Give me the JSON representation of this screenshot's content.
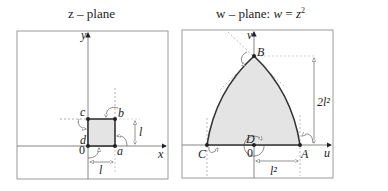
{
  "figure": {
    "left_panel": {
      "title": "z – plane",
      "axis_x_label": "x",
      "axis_y_label": "y",
      "origin_label": "0",
      "vertices": [
        {
          "label": "a",
          "x": 1,
          "y": 0
        },
        {
          "label": "b",
          "x": 1,
          "y": 1
        },
        {
          "label": "c",
          "x": 0,
          "y": 1
        },
        {
          "label": "d",
          "x": 0,
          "y": 0
        }
      ],
      "dimension_horizontal": "l",
      "dimension_vertical": "l",
      "shape": "square of side l",
      "fill_color": "#e4e4e4"
    },
    "right_panel": {
      "title": "w – plane: w = z²",
      "title_prefix": "w – plane: ",
      "title_eq_lhs": "w",
      "title_eq_mid": " = ",
      "title_eq_rhs": "z",
      "title_eq_sup": "2",
      "axis_u_label": "u",
      "axis_v_label": "v",
      "origin_label": "0",
      "vertices": [
        {
          "label": "A",
          "u": 1,
          "v": 0
        },
        {
          "label": "B",
          "u": 0,
          "v": 2
        },
        {
          "label": "C",
          "u": -1,
          "v": 0
        },
        {
          "label": "D",
          "u": 0,
          "v": 0
        }
      ],
      "dimension_horizontal": "l²",
      "dimension_vertical": "2l²",
      "shape": "parabolic region bounded by arcs",
      "fill_color": "#e4e4e4"
    }
  }
}
